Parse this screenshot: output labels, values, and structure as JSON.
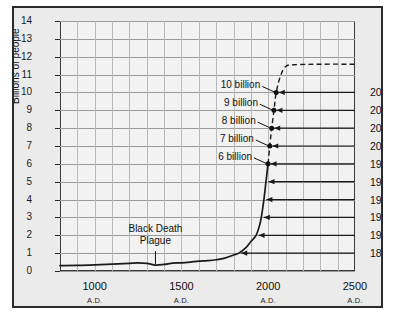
{
  "chart_data": {
    "type": "line",
    "title": "",
    "xlabel": "Year",
    "ylabel": "Billions of people",
    "xlim": [
      800,
      2500
    ],
    "ylim": [
      0,
      14
    ],
    "yticks": [
      0,
      1,
      2,
      3,
      4,
      5,
      6,
      7,
      8,
      9,
      10,
      11,
      12,
      13,
      14
    ],
    "xticks": [
      1000,
      1500,
      2000,
      2500
    ],
    "xtick_labels": [
      "1000",
      "1500",
      "2000",
      "2500"
    ],
    "xtick_sublabels": [
      "A.D.",
      "A.D.",
      "A.D.",
      "A.D."
    ],
    "grid": true,
    "grid_x_step": 100,
    "grid_y_step": 1,
    "series": [
      {
        "name": "Historical world population",
        "style": "solid",
        "points": [
          [
            800,
            0.3
          ],
          [
            900,
            0.31
          ],
          [
            1000,
            0.34
          ],
          [
            1100,
            0.38
          ],
          [
            1200,
            0.43
          ],
          [
            1250,
            0.45
          ],
          [
            1300,
            0.43
          ],
          [
            1350,
            0.33
          ],
          [
            1400,
            0.37
          ],
          [
            1450,
            0.44
          ],
          [
            1500,
            0.46
          ],
          [
            1550,
            0.5
          ],
          [
            1600,
            0.55
          ],
          [
            1650,
            0.58
          ],
          [
            1700,
            0.63
          ],
          [
            1750,
            0.72
          ],
          [
            1800,
            0.9
          ],
          [
            1830,
            1.0
          ],
          [
            1870,
            1.3
          ],
          [
            1900,
            1.65
          ],
          [
            1930,
            2.0
          ],
          [
            1950,
            2.55
          ],
          [
            1960,
            3.0
          ],
          [
            1975,
            4.0
          ],
          [
            1987,
            5.0
          ],
          [
            1999,
            6.0
          ]
        ]
      },
      {
        "name": "Projected world population",
        "style": "dashed",
        "points": [
          [
            1999,
            6.0
          ],
          [
            2009,
            7.0
          ],
          [
            2020,
            8.0
          ],
          [
            2033,
            9.0
          ],
          [
            2046,
            10.0
          ],
          [
            2070,
            10.9
          ],
          [
            2100,
            11.45
          ],
          [
            2150,
            11.55
          ],
          [
            2300,
            11.58
          ],
          [
            2500,
            11.58
          ]
        ]
      }
    ],
    "milestones": [
      {
        "label": "6 billion",
        "year": 1999,
        "value": 6,
        "year_label": "1999"
      },
      {
        "label": "7 billion",
        "year": 2009,
        "value": 7,
        "year_label": "2009"
      },
      {
        "label": "8 billion",
        "year": 2020,
        "value": 8,
        "year_label": "2020"
      },
      {
        "label": "9 billion",
        "year": 2033,
        "value": 9,
        "year_label": "2033"
      },
      {
        "label": "10 billion",
        "year": 2046,
        "value": 10,
        "year_label": "2046"
      }
    ],
    "year_markers": [
      {
        "year_label": "2046",
        "value": 10.0
      },
      {
        "year_label": "2033",
        "value": 9.0
      },
      {
        "year_label": "2020",
        "value": 8.0
      },
      {
        "year_label": "2009",
        "value": 7.0
      },
      {
        "year_label": "1999",
        "value": 6.0
      },
      {
        "year_label": "1987",
        "value": 5.0
      },
      {
        "year_label": "1975",
        "value": 4.0
      },
      {
        "year_label": "1960",
        "value": 3.0
      },
      {
        "year_label": "1930",
        "value": 2.0
      },
      {
        "year_label": "1830",
        "value": 1.0
      }
    ],
    "annotations": [
      {
        "name": "black-death",
        "line1": "Black Death",
        "line2": "Plague",
        "year": 1350,
        "value": 0.33
      }
    ],
    "projection_plateau": 11.58
  },
  "axes": {
    "y_label": "Billions of people",
    "x_label": "Year",
    "y_tick_labels": [
      "14",
      "13",
      "12",
      "11",
      "10",
      "9",
      "8",
      "7",
      "6",
      "5",
      "4",
      "3",
      "2",
      "1",
      "0"
    ],
    "x_tick_labels": [
      "1000",
      "1500",
      "2000",
      "2500"
    ],
    "x_tick_sublabel": "A.D."
  },
  "labels": {
    "b10": "10 billion",
    "b9": "9 billion",
    "b8": "8 billion",
    "b7": "7 billion",
    "b6": "6 billion",
    "black_death_line1": "Black Death",
    "black_death_line2": "Plague"
  },
  "years": {
    "y2046": "2046",
    "y2033": "2033",
    "y2020": "2020",
    "y2009": "2009",
    "y1999": "1999",
    "y1987": "1987",
    "y1975": "1975",
    "y1960": "1960",
    "y1930": "1930",
    "y1830": "1830"
  },
  "colors": {
    "frame": "#2b2b2b",
    "figure_background": "#ebebeb",
    "plot_background": "#f2f2f2",
    "gridline": "#b9b9b9",
    "curve": "#1a1a1a",
    "text": "#111111"
  }
}
